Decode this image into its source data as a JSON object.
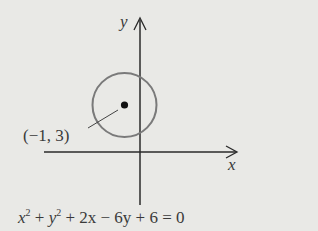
{
  "diagram": {
    "type": "circle-on-coordinate-plane",
    "axes": {
      "x_label": "x",
      "y_label": "y"
    },
    "circle": {
      "center_label": "(−1, 3)",
      "center": [
        -1,
        3
      ],
      "radius": 2,
      "stroke_color": "#7a7a7a"
    },
    "equation": {
      "x": "x",
      "x_exp": "2",
      "plus1": " + ",
      "y": "y",
      "y_exp": "2",
      "rest": " +  2x − 6y + 6 = 0"
    },
    "colors": {
      "background": "#e9e9e6",
      "axes": "#2a2a2a",
      "text": "#3a3a3a"
    }
  }
}
